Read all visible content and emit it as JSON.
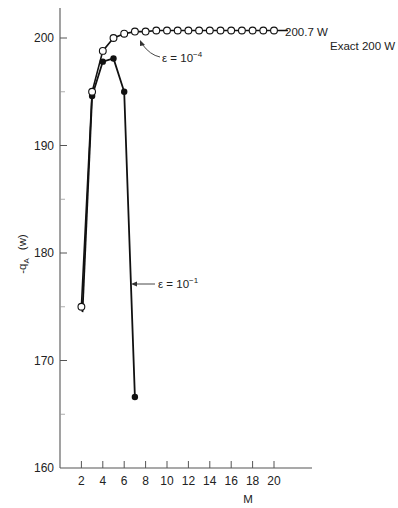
{
  "chart_data": {
    "type": "line",
    "title": "",
    "xlabel": "M",
    "ylabel": "-q_A (w)",
    "xlim": [
      0,
      21.5
    ],
    "ylim": [
      160,
      203
    ],
    "x_ticks": [
      2,
      4,
      6,
      8,
      10,
      12,
      14,
      16,
      18,
      20
    ],
    "y_ticks_labeled": [
      160,
      170,
      180,
      190,
      200
    ],
    "y_ticks_minor": [
      165,
      175,
      185,
      195
    ],
    "grid": false,
    "series": [
      {
        "name": "ε = 10^-4",
        "marker": "open-circle",
        "x": [
          2,
          3,
          4,
          5,
          6,
          7,
          8,
          9,
          10,
          11,
          12,
          13,
          14,
          15,
          16,
          17,
          18,
          19,
          20
        ],
        "values": [
          175.0,
          195.0,
          198.8,
          200.0,
          200.4,
          200.6,
          200.6,
          200.7,
          200.7,
          200.7,
          200.7,
          200.7,
          200.7,
          200.7,
          200.7,
          200.7,
          200.7,
          200.7,
          200.7
        ],
        "line_extends_to_x": 21.3
      },
      {
        "name": "ε = 10^-1",
        "marker": "filled-circle",
        "x": [
          3,
          4,
          5,
          6,
          7
        ],
        "values": [
          194.6,
          197.8,
          198.1,
          195.0,
          166.6
        ],
        "line_from_x": 2.0,
        "line_from_y": 167.5
      }
    ],
    "annotations": [
      {
        "text_prefix": "ε = 10",
        "text_sup": "−4",
        "points_to_series": "ε = 10^-4"
      },
      {
        "text_prefix": "ε = 10",
        "text_sup": "−1",
        "points_to_series": "ε = 10^-1"
      },
      {
        "text": "200.7 W",
        "position": "end of ε = 10^-4 line"
      },
      {
        "text": "Exact 200 W",
        "position": "right of plot"
      }
    ]
  },
  "labels": {
    "ylabel_main": "-q",
    "ylabel_sub": "A",
    "ylabel_unit": "(w)",
    "xlabel": "M",
    "converged_value": "200.7 W",
    "exact_value": "Exact 200 W",
    "eps4_prefix": "ε = 10",
    "eps4_sup": "−4",
    "eps1_prefix": "ε = 10",
    "eps1_sup": "−1"
  },
  "style": {
    "line_color": "#111111",
    "axis_color": "#555555",
    "background": "#ffffff"
  }
}
